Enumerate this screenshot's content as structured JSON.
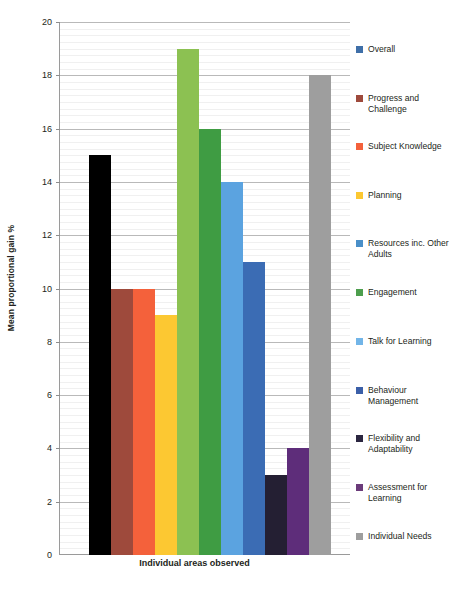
{
  "chart_data": {
    "type": "bar",
    "title": "",
    "xlabel": "Individual areas observed",
    "ylabel": "Mean proportional gain %",
    "ylim": [
      0,
      20
    ],
    "ytick_step": 2,
    "yticks": [
      0,
      2,
      4,
      6,
      8,
      10,
      12,
      14,
      16,
      18,
      20
    ],
    "minor_grid": true,
    "minor_grid_step": 0.25,
    "grid": true,
    "legend_position": "right",
    "categories": [
      "Overall",
      "Progress and Challenge",
      "Subject Knowledge",
      "Planning",
      "Resources inc. Other Adults",
      "Engagement",
      "Talk for Learning",
      "Behaviour Management",
      "Flexibility and Adaptability",
      "Assessment for Learning",
      "Individual Needs"
    ],
    "values": [
      15,
      10,
      10,
      9,
      19,
      16,
      14,
      11,
      3,
      4,
      18
    ],
    "bar_colors": [
      "#000000",
      "#9e4a3c",
      "#f4613b",
      "#fcc832",
      "#8cc152",
      "#3f9c43",
      "#5ba3e0",
      "#3b6cb4",
      "#241f33",
      "#5e2d7a",
      "#9e9e9e"
    ]
  },
  "legend": {
    "items": [
      {
        "label": "Overall",
        "color": "#3f6fa8"
      },
      {
        "label": "Progress and Challenge",
        "color": "#9e4a3c"
      },
      {
        "label": "Subject Knowledge",
        "color": "#f4613b"
      },
      {
        "label": "Planning",
        "color": "#fcc832"
      },
      {
        "label": "Resources inc. Other Adults",
        "color": "#4a8fc8"
      },
      {
        "label": "Engagement",
        "color": "#4d9e4d"
      },
      {
        "label": "Talk for Learning",
        "color": "#72b5e8"
      },
      {
        "label": "Behaviour Management",
        "color": "#3b5fa8"
      },
      {
        "label": "Flexibility and Adaptability",
        "color": "#2b2640"
      },
      {
        "label": "Assessment for Learning",
        "color": "#6b3b7a"
      },
      {
        "label": "Individual Needs",
        "color": "#9e9e9e"
      }
    ]
  },
  "caption": {
    "text": ""
  }
}
